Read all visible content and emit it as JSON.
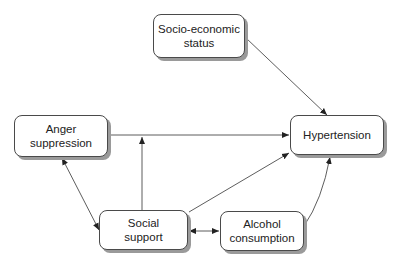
{
  "diagram": {
    "type": "path-diagram",
    "nodes": [
      {
        "id": "ses",
        "label": "Socio-economic status",
        "line1": "Socio-economic",
        "line2": "status"
      },
      {
        "id": "anger",
        "label": "Anger suppression",
        "line1": "Anger",
        "line2": "suppression"
      },
      {
        "id": "hyper",
        "label": "Hypertension",
        "line1": "Hypertension",
        "line2": ""
      },
      {
        "id": "social",
        "label": "Social support",
        "line1": "Social",
        "line2": "support"
      },
      {
        "id": "alcohol",
        "label": "Alcohol consumption",
        "line1": "Alcohol",
        "line2": "consumption"
      }
    ],
    "edges": [
      {
        "from": "ses",
        "to": "hyper",
        "type": "directed"
      },
      {
        "from": "anger",
        "to": "hyper",
        "type": "directed"
      },
      {
        "from": "social",
        "to": "anger-hyper-path",
        "type": "moderation"
      },
      {
        "from": "anger",
        "to": "social",
        "type": "bidirectional"
      },
      {
        "from": "social",
        "to": "hyper",
        "type": "directed"
      },
      {
        "from": "social",
        "to": "alcohol",
        "type": "bidirectional"
      },
      {
        "from": "alcohol",
        "to": "hyper",
        "type": "directed"
      }
    ]
  }
}
